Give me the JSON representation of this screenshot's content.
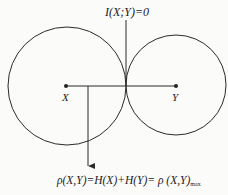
{
  "diagram": {
    "top_label": "I(X;Y)=0",
    "node_x_label": "X",
    "node_y_label": "Y",
    "bottom_label_main": "ρ(X,Y)=H(X)+H(Y)= ρ (X,Y)",
    "bottom_label_sub": "max",
    "colors": {
      "stroke": "#2a2a2a",
      "background": "#fbfbfa"
    }
  }
}
